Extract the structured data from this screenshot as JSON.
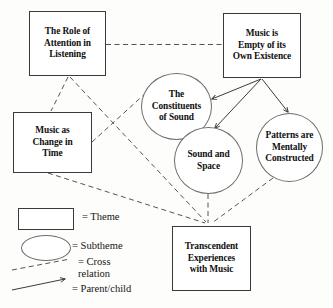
{
  "diagram": {
    "title_text_style": "bold serif",
    "nodes": [
      {
        "id": "role-attention",
        "label": "The Role of\nAttention in\nListening",
        "type": "theme",
        "x": 29,
        "y": 11,
        "w": 77,
        "h": 65
      },
      {
        "id": "music-empty",
        "label": "Music is\nEmpty of its\nOwn Existence",
        "type": "theme",
        "x": 223,
        "y": 13,
        "w": 78,
        "h": 65
      },
      {
        "id": "music-change",
        "label": "Music as\nChange in\nTime",
        "type": "theme",
        "x": 13,
        "y": 112,
        "w": 79,
        "h": 61
      },
      {
        "id": "transcendent",
        "label": "Transcendent\nExperiences\nwith Music",
        "type": "theme",
        "x": 172,
        "y": 226,
        "w": 79,
        "h": 65
      },
      {
        "id": "constituents",
        "label": "The\nConstituents\nof Sound",
        "type": "subtheme",
        "x": 141,
        "y": 73,
        "w": 71,
        "h": 67
      },
      {
        "id": "sound-space",
        "label": "Sound and\nSpace",
        "type": "subtheme",
        "x": 174,
        "y": 127,
        "w": 69,
        "h": 67
      },
      {
        "id": "patterns",
        "label": "Patterns are\nMentally\nConstructed",
        "type": "subtheme",
        "x": 256,
        "y": 113,
        "w": 67,
        "h": 69
      }
    ],
    "edges": [
      {
        "id": "role-to-empty",
        "kind": "cross-relation",
        "from": "role-attention",
        "to": "music-empty"
      },
      {
        "id": "role-to-change",
        "kind": "cross-relation",
        "from": "role-attention",
        "to": "music-change"
      },
      {
        "id": "role-to-transcendent",
        "kind": "cross-relation",
        "from": "role-attention",
        "to": "transcendent"
      },
      {
        "id": "change-to-constituents",
        "kind": "cross-relation",
        "from": "music-change",
        "to": "constituents"
      },
      {
        "id": "change-to-transcendent",
        "kind": "cross-relation",
        "from": "music-change",
        "to": "transcendent"
      },
      {
        "id": "soundspace-to-transcendent",
        "kind": "cross-relation",
        "from": "sound-space",
        "to": "transcendent"
      },
      {
        "id": "patterns-to-transcendent",
        "kind": "cross-relation",
        "from": "patterns",
        "to": "transcendent"
      },
      {
        "id": "empty-to-constituents",
        "kind": "parent-child",
        "from": "music-empty",
        "to": "constituents"
      },
      {
        "id": "empty-to-soundspace",
        "kind": "parent-child",
        "from": "music-empty",
        "to": "sound-space"
      },
      {
        "id": "empty-to-patterns",
        "kind": "parent-child",
        "from": "music-empty",
        "to": "patterns"
      }
    ],
    "legend": {
      "items": [
        {
          "id": "theme",
          "shape": "rectangle",
          "label": "= Theme"
        },
        {
          "id": "subtheme",
          "shape": "ellipse",
          "label": "= Subtheme"
        },
        {
          "id": "cross-relation",
          "shape": "dashed-line",
          "label": "= Cross\nrelation"
        },
        {
          "id": "parent-child",
          "shape": "solid-arrow",
          "label": "= Parent/child"
        }
      ]
    },
    "colors": {
      "theme_border": "#3a3a38",
      "subtheme_border": "#6d6d6b",
      "dashed_edge": "#55545a",
      "solid_edge": "#3b3b40",
      "text": "#10100f",
      "background": "#fdfdfc"
    }
  }
}
